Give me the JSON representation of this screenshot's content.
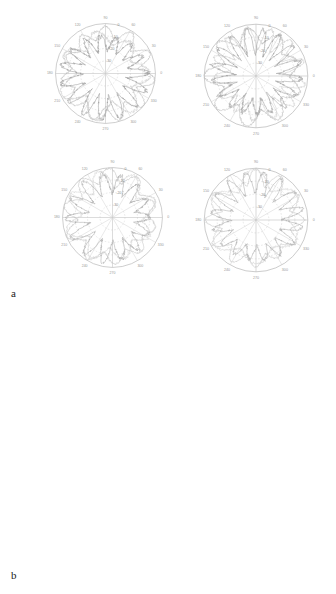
{
  "figure": {
    "kind": "multi-panel-polar-figure",
    "background": "#ffffff",
    "panels": [
      {
        "id": "a",
        "label": "a"
      },
      {
        "id": "b",
        "label": "b"
      }
    ]
  },
  "chart_data": [
    {
      "id": "a1",
      "panel": "a",
      "position": "top-left",
      "type": "line",
      "coordinate_system": "polar",
      "title": "",
      "xlabel": "",
      "ylabel": "",
      "angle_unit": "degrees",
      "angle_ticks": [
        0,
        30,
        60,
        90,
        120,
        150,
        180,
        210,
        240,
        270,
        300,
        330
      ],
      "angle_tick_labels": [
        "0",
        "30",
        "60",
        "90",
        "120",
        "150",
        "180",
        "210",
        "240",
        "270",
        "300",
        "330"
      ],
      "radial_ticks": [
        -40,
        -30,
        -20,
        -10,
        0
      ],
      "radial_tick_labels": [
        "-40",
        "-30",
        "-20",
        "-10",
        "0"
      ],
      "rlim": [
        -40,
        0
      ],
      "rlabel_angle": 75,
      "grid": true,
      "legend": "none",
      "series": [
        {
          "name": "pattern-1",
          "color": "#b9b9b9",
          "lobe_count": 11,
          "lobe_depth": 22,
          "base_level": -13,
          "peak_level": 0,
          "noise": 2.0,
          "phase": 8,
          "seed": 11
        },
        {
          "name": "pattern-2",
          "color": "#cccccc",
          "lobe_count": 7,
          "lobe_depth": 26,
          "base_level": -17,
          "peak_level": -1,
          "noise": 3.4,
          "phase": 52,
          "seed": 23
        },
        {
          "name": "pattern-3",
          "color": "#9e9e9e",
          "lobe_count": 15,
          "lobe_depth": 30,
          "base_level": -22,
          "peak_level": -2,
          "noise": 5.5,
          "phase": 95,
          "seed": 37
        }
      ]
    },
    {
      "id": "a2",
      "panel": "a",
      "position": "top-right",
      "type": "line",
      "coordinate_system": "polar",
      "title": "",
      "xlabel": "",
      "ylabel": "",
      "angle_unit": "degrees",
      "angle_ticks": [
        0,
        30,
        60,
        90,
        120,
        150,
        180,
        210,
        240,
        270,
        300,
        330
      ],
      "angle_tick_labels": [
        "0",
        "30",
        "60",
        "90",
        "120",
        "150",
        "180",
        "210",
        "240",
        "270",
        "300",
        "330"
      ],
      "radial_ticks": [
        -40,
        -30,
        -20,
        -10,
        0
      ],
      "radial_tick_labels": [
        "-40",
        "-30",
        "-20",
        "-10",
        "0"
      ],
      "rlim": [
        -40,
        0
      ],
      "rlabel_angle": 75,
      "grid": true,
      "legend": "none",
      "series": [
        {
          "name": "pattern-1",
          "color": "#bdbdbd",
          "lobe_count": 9,
          "lobe_depth": 24,
          "base_level": -14,
          "peak_level": 0,
          "noise": 2.6,
          "phase": 21,
          "seed": 5
        },
        {
          "name": "pattern-2",
          "color": "#cfcfcf",
          "lobe_count": 13,
          "lobe_depth": 27,
          "base_level": -19,
          "peak_level": -1,
          "noise": 3.9,
          "phase": 66,
          "seed": 41
        },
        {
          "name": "pattern-3",
          "color": "#a5a5a5",
          "lobe_count": 17,
          "lobe_depth": 31,
          "base_level": -23,
          "peak_level": -2,
          "noise": 6.0,
          "phase": 110,
          "seed": 57
        }
      ]
    },
    {
      "id": "a3",
      "panel": "a",
      "position": "bottom-left",
      "type": "line",
      "coordinate_system": "polar",
      "title": "",
      "xlabel": "",
      "ylabel": "",
      "angle_unit": "degrees",
      "angle_ticks": [
        0,
        30,
        60,
        90,
        120,
        150,
        180,
        210,
        240,
        270,
        300,
        330
      ],
      "angle_tick_labels": [
        "0",
        "30",
        "60",
        "90",
        "120",
        "150",
        "180",
        "210",
        "240",
        "270",
        "300",
        "330"
      ],
      "radial_ticks": [
        -40,
        -30,
        -20,
        -10,
        0
      ],
      "radial_tick_labels": [
        "-40",
        "-30",
        "-20",
        "-10",
        "0"
      ],
      "rlim": [
        -40,
        0
      ],
      "rlabel_angle": 75,
      "grid": true,
      "legend": "none",
      "series": [
        {
          "name": "pattern-1",
          "color": "#c2c2c2",
          "lobe_count": 10,
          "lobe_depth": 25,
          "base_level": -12,
          "peak_level": 0,
          "noise": 2.2,
          "phase": 14,
          "seed": 71
        },
        {
          "name": "pattern-2",
          "color": "#d2d2d2",
          "lobe_count": 8,
          "lobe_depth": 23,
          "base_level": -16,
          "peak_level": -1,
          "noise": 3.0,
          "phase": 73,
          "seed": 83
        },
        {
          "name": "pattern-3",
          "color": "#ababab",
          "lobe_count": 14,
          "lobe_depth": 29,
          "base_level": -21,
          "peak_level": -2,
          "noise": 4.8,
          "phase": 128,
          "seed": 97
        }
      ]
    },
    {
      "id": "a4",
      "panel": "a",
      "position": "bottom-right",
      "type": "line",
      "coordinate_system": "polar",
      "title": "",
      "xlabel": "",
      "ylabel": "",
      "angle_unit": "degrees",
      "angle_ticks": [
        0,
        30,
        60,
        90,
        120,
        150,
        180,
        210,
        240,
        270,
        300,
        330
      ],
      "angle_tick_labels": [
        "0",
        "30",
        "60",
        "90",
        "120",
        "150",
        "180",
        "210",
        "240",
        "270",
        "300",
        "330"
      ],
      "radial_ticks": [
        -40,
        -30,
        -20,
        -10,
        0
      ],
      "radial_tick_labels": [
        "-40",
        "-30",
        "-20",
        "-10",
        "0"
      ],
      "rlim": [
        -40,
        0
      ],
      "rlabel_angle": 75,
      "grid": true,
      "legend": "none",
      "series": [
        {
          "name": "pattern-1",
          "color": "#c6c6c6",
          "lobe_count": 12,
          "lobe_depth": 26,
          "base_level": -13,
          "peak_level": 0,
          "noise": 1.8,
          "phase": 30,
          "seed": 103
        },
        {
          "name": "pattern-2",
          "color": "#d6d6d6",
          "lobe_count": 6,
          "lobe_depth": 22,
          "base_level": -15,
          "peak_level": -1,
          "noise": 2.5,
          "phase": 88,
          "seed": 113
        },
        {
          "name": "pattern-3",
          "color": "#b0b0b0",
          "lobe_count": 16,
          "lobe_depth": 28,
          "base_level": -20,
          "peak_level": -2,
          "noise": 4.2,
          "phase": 145,
          "seed": 131
        }
      ]
    },
    {
      "id": "b1",
      "panel": "b",
      "position": "top-left",
      "type": "line",
      "coordinate_system": "polar",
      "title": "",
      "xlabel": "",
      "ylabel": "",
      "angle_unit": "degrees",
      "angle_ticks": [
        0,
        30,
        60,
        90,
        120,
        150,
        180,
        210,
        240,
        270,
        300,
        330
      ],
      "angle_tick_labels": [
        "0",
        "30",
        "60",
        "90",
        "120",
        "150",
        "180",
        "210",
        "240",
        "270",
        "300",
        "330"
      ],
      "radial_ticks": [
        -40,
        -30,
        -20,
        -10,
        0
      ],
      "radial_tick_labels": [
        "-40",
        "-30",
        "-20",
        "-10",
        "0"
      ],
      "rlim": [
        -40,
        0
      ],
      "rlabel_angle": 75,
      "grid": true,
      "legend": "none",
      "series": [
        {
          "name": "pattern-1",
          "color": "#c9c9c9",
          "lobe_count": 11,
          "lobe_depth": 24,
          "base_level": -14,
          "peak_level": 0,
          "noise": 2.4,
          "phase": 5,
          "seed": 149
        },
        {
          "name": "pattern-2",
          "color": "#d8d8d8",
          "lobe_count": 9,
          "lobe_depth": 21,
          "base_level": -17,
          "peak_level": -1,
          "noise": 3.2,
          "phase": 60,
          "seed": 163
        },
        {
          "name": "pattern-3",
          "color": "#b3b3b3",
          "lobe_count": 15,
          "lobe_depth": 30,
          "base_level": -22,
          "peak_level": -2,
          "noise": 5.0,
          "phase": 118,
          "seed": 179
        }
      ]
    },
    {
      "id": "b2",
      "panel": "b",
      "position": "top-right",
      "type": "line",
      "coordinate_system": "polar",
      "title": "",
      "xlabel": "",
      "ylabel": "",
      "angle_unit": "degrees",
      "angle_ticks": [
        0,
        30,
        60,
        90,
        120,
        150,
        180,
        210,
        240,
        270,
        300,
        330
      ],
      "angle_tick_labels": [
        "0",
        "30",
        "60",
        "90",
        "120",
        "150",
        "180",
        "210",
        "240",
        "270",
        "300",
        "330"
      ],
      "radial_ticks": [
        -40,
        -30,
        -20,
        -10,
        0
      ],
      "radial_tick_labels": [
        "-40",
        "-30",
        "-20",
        "-10",
        "0"
      ],
      "rlim": [
        -40,
        0
      ],
      "rlabel_angle": 75,
      "grid": true,
      "legend": "none",
      "series": [
        {
          "name": "pattern-1",
          "color": "#bfbfbf",
          "lobe_count": 8,
          "lobe_depth": 27,
          "base_level": -13,
          "peak_level": 0,
          "noise": 2.8,
          "phase": 40,
          "seed": 191
        },
        {
          "name": "pattern-2",
          "color": "#d0d0d0",
          "lobe_count": 12,
          "lobe_depth": 25,
          "base_level": -18,
          "peak_level": -1,
          "noise": 3.6,
          "phase": 97,
          "seed": 211
        },
        {
          "name": "pattern-3",
          "color": "#a8a8a8",
          "lobe_count": 18,
          "lobe_depth": 32,
          "base_level": -24,
          "peak_level": -2,
          "noise": 5.8,
          "phase": 155,
          "seed": 223
        }
      ]
    },
    {
      "id": "b3",
      "panel": "b",
      "position": "bottom-left",
      "type": "line",
      "coordinate_system": "polar",
      "title": "",
      "xlabel": "",
      "ylabel": "",
      "angle_unit": "degrees",
      "angle_ticks": [
        0,
        30,
        60,
        90,
        120,
        150,
        180,
        210,
        240,
        270,
        300,
        330
      ],
      "angle_tick_labels": [
        "0",
        "30",
        "60",
        "90",
        "120",
        "150",
        "180",
        "210",
        "240",
        "270",
        "300",
        "330"
      ],
      "radial_ticks": [
        -40,
        -30,
        -20,
        -10,
        0
      ],
      "radial_tick_labels": [
        "-40",
        "-30",
        "-20",
        "-10",
        "0"
      ],
      "rlim": [
        -40,
        0
      ],
      "rlabel_angle": 75,
      "grid": true,
      "legend": "none",
      "series": [
        {
          "name": "pattern-1",
          "color": "#bcbcbc",
          "lobe_count": 10,
          "lobe_depth": 28,
          "base_level": -11,
          "peak_level": 0,
          "noise": 3.0,
          "phase": 18,
          "seed": 233
        },
        {
          "name": "pattern-2",
          "color": "#cdcdcd",
          "lobe_count": 14,
          "lobe_depth": 26,
          "base_level": -16,
          "peak_level": -1,
          "noise": 4.0,
          "phase": 80,
          "seed": 251
        },
        {
          "name": "pattern-3",
          "color": "#a2a2a2",
          "lobe_count": 19,
          "lobe_depth": 33,
          "base_level": -23,
          "peak_level": -2,
          "noise": 6.4,
          "phase": 139,
          "seed": 269
        }
      ]
    },
    {
      "id": "b4",
      "panel": "b",
      "position": "bottom-right",
      "type": "line",
      "coordinate_system": "polar",
      "title": "",
      "xlabel": "",
      "ylabel": "",
      "angle_unit": "degrees",
      "angle_ticks": [
        0,
        30,
        60,
        90,
        120,
        150,
        180,
        210,
        240,
        270,
        300,
        330
      ],
      "angle_tick_labels": [
        "0",
        "30",
        "60",
        "90",
        "120",
        "150",
        "180",
        "210",
        "240",
        "270",
        "300",
        "330"
      ],
      "radial_ticks": [
        -40,
        -30,
        -20,
        -10,
        0
      ],
      "radial_tick_labels": [
        "-40",
        "-30",
        "-20",
        "-10",
        "0"
      ],
      "rlim": [
        -40,
        0
      ],
      "rlabel_angle": 75,
      "grid": true,
      "legend": "none",
      "series": [
        {
          "name": "pattern-1",
          "color": "#b4b4b4",
          "lobe_count": 13,
          "lobe_depth": 29,
          "base_level": -12,
          "peak_level": 0,
          "noise": 3.4,
          "phase": 26,
          "seed": 281
        },
        {
          "name": "pattern-2",
          "color": "#c8c8c8",
          "lobe_count": 16,
          "lobe_depth": 27,
          "base_level": -17,
          "peak_level": -1,
          "noise": 4.6,
          "phase": 104,
          "seed": 293
        },
        {
          "name": "pattern-3",
          "color": "#9b9b9b",
          "lobe_count": 20,
          "lobe_depth": 34,
          "base_level": -25,
          "peak_level": -2,
          "noise": 6.8,
          "phase": 168,
          "seed": 307
        }
      ]
    }
  ],
  "layout": {
    "plot_boxes": {
      "a1": {
        "left": 38,
        "top": 6,
        "size": 135
      },
      "a2": {
        "left": 186,
        "top": 6,
        "size": 140
      },
      "a3": {
        "left": 45,
        "top": 150,
        "size": 135
      },
      "a4": {
        "left": 186,
        "top": 150,
        "size": 140
      },
      "b1": {
        "left": 45,
        "top": 306,
        "size": 135
      },
      "b2": {
        "left": 186,
        "top": 306,
        "size": 140
      },
      "b3": {
        "left": 45,
        "top": 446,
        "size": 135
      },
      "b4": {
        "left": 186,
        "top": 446,
        "size": 140
      }
    }
  }
}
